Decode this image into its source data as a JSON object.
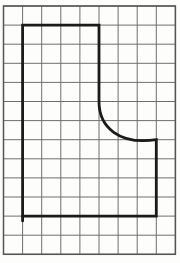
{
  "figure": {
    "width": 180,
    "height": 263,
    "background": "#fdfdfc",
    "grid": {
      "columns": 9,
      "rows": 13,
      "origin_x": 3.5,
      "origin_y": 6,
      "cell_size": 19.1,
      "line_color": "#6f6f6f",
      "line_width": 1,
      "border_color": "#555555",
      "border_width": 1.5
    },
    "shape": {
      "description": "bold hand-drawn outline: rectangle 7 cells wide by 10 cells tall with upper-right corner removed by a concave curve; curve runs from (5,5) vertical-tangent to (8,7) horizontal-tangent",
      "stroke_color": "#1b1b1b",
      "stroke_width": 2.8,
      "path_grid": [
        {
          "cmd": "M",
          "pts": [
            [
              1,
              1
            ]
          ]
        },
        {
          "cmd": "L",
          "pts": [
            [
              5,
              1
            ]
          ]
        },
        {
          "cmd": "L",
          "pts": [
            [
              5,
              5
            ]
          ]
        },
        {
          "cmd": "C",
          "pts": [
            [
              5,
              6.35
            ],
            [
              6.05,
              7.28
            ],
            [
              8,
              7
            ]
          ]
        },
        {
          "cmd": "L",
          "pts": [
            [
              8,
              11
            ]
          ]
        },
        {
          "cmd": "L",
          "pts": [
            [
              1,
              11
            ]
          ]
        },
        {
          "cmd": "Z",
          "pts": []
        }
      ],
      "overshoot_stub": {
        "from": [
          1,
          11
        ],
        "to": [
          1,
          11.25
        ]
      }
    }
  }
}
